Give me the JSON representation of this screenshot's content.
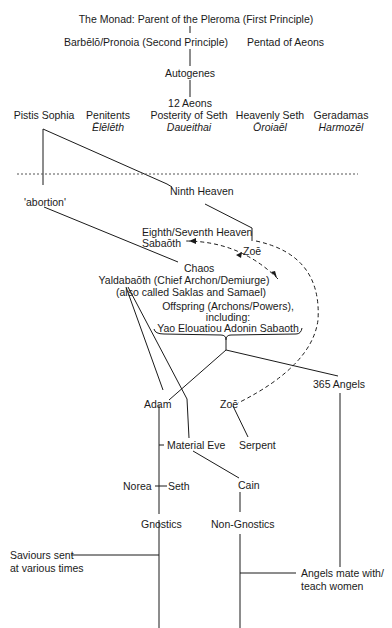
{
  "diagram": {
    "title_nodes": {
      "monad": "The Monad: Parent of the Pleroma (First Principle)",
      "barbelo": "Barbēlō/Pronoia (Second Principle)",
      "pentad": "Pentad of Aeons",
      "autogenes": "Autogenes",
      "twelve_aeons": "12 Aeons"
    },
    "aeons_row": [
      {
        "name": "Pistis Sophia",
        "luminary": ""
      },
      {
        "name": "Penitents",
        "luminary": "Ēlēlēth"
      },
      {
        "name": "Posterity of Seth",
        "luminary": "Daueithai"
      },
      {
        "name": "Heavenly Seth",
        "luminary": "Ōroiaēl"
      },
      {
        "name": "Geradamas",
        "luminary": "Harmozēl"
      }
    ],
    "lower_nodes": {
      "ninth_heaven": "Ninth Heaven",
      "abortion": "'abortion'",
      "eighth_seventh_heaven": "Eighth/Seventh Heaven",
      "sabaoth": "Sabaōth",
      "zoe_upper": "Zoē",
      "chaos": "Chaos",
      "yaldabaoth": "Yaldabaōth (Chief Archon/Demiurge)",
      "also_called": "(also called Saklas and Samael)",
      "offspring_1": "Offspring (Archons/Powers),",
      "offspring_2": "including:",
      "offspring_3": "Yao Elouatiou Adonin Sabaoth",
      "angels_365": "365 Angels",
      "adam": "Adam",
      "zoe_lower": "Zoē",
      "material_eve": "Material Eve",
      "serpent": "Serpent",
      "norea": "Norea",
      "seth": "Seth",
      "cain": "Cain",
      "gnostics": "Gnostics",
      "non_gnostics": "Non-Gnostics",
      "saviours_1": "Saviours sent",
      "saviours_2": "at various times",
      "angels_mate_1": "Angels mate with/",
      "angels_mate_2": "teach women"
    },
    "colors": {
      "line": "#1a1a1a",
      "background": "#ffffff"
    }
  }
}
